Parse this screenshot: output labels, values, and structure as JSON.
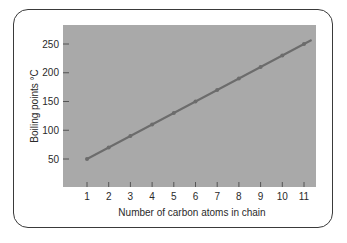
{
  "chart_data": {
    "type": "line",
    "title": "",
    "xlabel": "Number of carbon atoms in chain",
    "ylabel": "Boiling points °C",
    "x": [
      1,
      2,
      3,
      4,
      5,
      6,
      7,
      8,
      9,
      10,
      11
    ],
    "series": [
      {
        "name": "Boiling point",
        "values": [
          50,
          70,
          90,
          110,
          130,
          150,
          170,
          190,
          210,
          230,
          250
        ]
      }
    ],
    "x_ticks": [
      "1",
      "2",
      "3",
      "4",
      "5",
      "6",
      "7",
      "8",
      "9",
      "10",
      "11"
    ],
    "y_ticks": [
      "50",
      "100",
      "150",
      "200",
      "250"
    ],
    "ylim": [
      0,
      275
    ],
    "xlim": [
      0,
      11.5
    ],
    "grid": false,
    "legend": "none",
    "colors": {
      "plot_background": "#a9a9a9",
      "line": "#6c6c6c",
      "marker": "#6c6c6c",
      "frame_border": "#3a3a3a",
      "text": "#2a2a2a"
    }
  }
}
